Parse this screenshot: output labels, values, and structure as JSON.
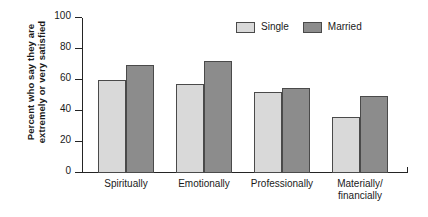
{
  "chart_data": {
    "type": "bar",
    "title": "",
    "xlabel": "",
    "ylabel": "Percent who say they are extremely or very satisfied",
    "ylabel_line1": "Percent who say they are",
    "ylabel_line2": "extremely or very satisfied",
    "categories": [
      "Spiritually",
      "Emotionally",
      "Professionally",
      "Materially/financially"
    ],
    "category_lines": [
      [
        "Spiritually"
      ],
      [
        "Emotionally"
      ],
      [
        "Professionally"
      ],
      [
        "Materially/",
        "financially"
      ]
    ],
    "series": [
      {
        "name": "Single",
        "color": "#d9d9d9",
        "values": [
          60,
          57.5,
          52.5,
          36
        ]
      },
      {
        "name": "Married",
        "color": "#8c8c8c",
        "values": [
          70,
          72.5,
          55,
          49.5
        ]
      }
    ],
    "ylim": [
      0,
      100
    ],
    "yticks": [
      0,
      20,
      40,
      60,
      80,
      100
    ],
    "ytick_labels": [
      "0",
      "20",
      "40",
      "60",
      "80",
      "100"
    ],
    "grid": false,
    "legend_position": "top-right",
    "legend": [
      {
        "label": "Single",
        "color": "#d9d9d9"
      },
      {
        "label": "Married",
        "color": "#8c8c8c"
      }
    ]
  },
  "colors": {
    "single": "#d9d9d9",
    "married": "#8c8c8c",
    "axis": "#242424",
    "bar_border": "#4a4a4a",
    "background": "#ffffff"
  }
}
